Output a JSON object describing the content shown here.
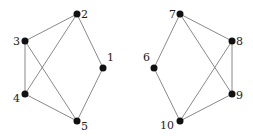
{
  "graphs": [
    {
      "name": "left-graph",
      "nodes": [
        {
          "id": "1",
          "label": "1",
          "x": 103,
          "y": 68,
          "lx": 107,
          "ly": 61,
          "anchor": "start"
        },
        {
          "id": "2",
          "label": "2",
          "x": 77,
          "y": 14,
          "lx": 81,
          "ly": 18,
          "anchor": "start"
        },
        {
          "id": "3",
          "label": "3",
          "x": 25,
          "y": 41,
          "lx": 20,
          "ly": 45,
          "anchor": "end"
        },
        {
          "id": "4",
          "label": "4",
          "x": 25,
          "y": 94,
          "lx": 20,
          "ly": 102,
          "anchor": "end"
        },
        {
          "id": "5",
          "label": "5",
          "x": 77,
          "y": 121,
          "lx": 81,
          "ly": 130,
          "anchor": "start"
        }
      ],
      "edges": [
        [
          "2",
          "3"
        ],
        [
          "2",
          "4"
        ],
        [
          "2",
          "1"
        ],
        [
          "3",
          "4"
        ],
        [
          "3",
          "5"
        ],
        [
          "4",
          "5"
        ],
        [
          "1",
          "5"
        ]
      ]
    },
    {
      "name": "right-graph",
      "nodes": [
        {
          "id": "6",
          "label": "6",
          "x": 154,
          "y": 68,
          "lx": 150,
          "ly": 61,
          "anchor": "end"
        },
        {
          "id": "7",
          "label": "7",
          "x": 180,
          "y": 14,
          "lx": 176,
          "ly": 18,
          "anchor": "end"
        },
        {
          "id": "8",
          "label": "8",
          "x": 232,
          "y": 41,
          "lx": 236,
          "ly": 45,
          "anchor": "start"
        },
        {
          "id": "9",
          "label": "9",
          "x": 232,
          "y": 94,
          "lx": 236,
          "ly": 99,
          "anchor": "start"
        },
        {
          "id": "10",
          "label": "10",
          "x": 180,
          "y": 121,
          "lx": 174,
          "ly": 129,
          "anchor": "end"
        }
      ],
      "edges": [
        [
          "7",
          "8"
        ],
        [
          "7",
          "6"
        ],
        [
          "7",
          "9"
        ],
        [
          "8",
          "9"
        ],
        [
          "8",
          "10"
        ],
        [
          "6",
          "10"
        ],
        [
          "9",
          "10"
        ]
      ]
    }
  ],
  "style": {
    "edge_color": "#6b6b6b",
    "node_color": "#111111",
    "node_radius": 3.5
  }
}
